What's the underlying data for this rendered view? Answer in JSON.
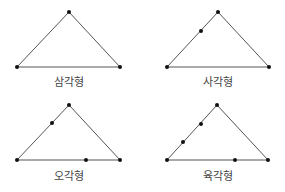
{
  "figures": [
    {
      "label": "삼각형",
      "vertices": [
        [
          69,
          12
        ],
        [
          17,
          67
        ],
        [
          120,
          67
        ]
      ],
      "extra_points": [],
      "label_pos": [
        69,
        86
      ]
    },
    {
      "label": "사각형",
      "vertices": [
        [
          218,
          12
        ],
        [
          167,
          67
        ],
        [
          269,
          67
        ]
      ],
      "extra_points": [
        [
          201,
          31
        ]
      ],
      "label_pos": [
        218,
        86
      ]
    },
    {
      "label": "오각형",
      "vertices": [
        [
          69,
          105
        ],
        [
          17,
          160
        ],
        [
          120,
          160
        ]
      ],
      "extra_points": [
        [
          52,
          123
        ],
        [
          86,
          160
        ]
      ],
      "label_pos": [
        69,
        180
      ]
    },
    {
      "label": "육각형",
      "vertices": [
        [
          217,
          105
        ],
        [
          167,
          160
        ],
        [
          268,
          160
        ]
      ],
      "extra_points": [
        [
          201,
          124
        ],
        [
          183,
          142
        ],
        [
          235,
          160
        ]
      ],
      "label_pos": [
        218,
        180
      ]
    }
  ],
  "colors": {
    "edge": "#555555",
    "point": "#111111",
    "label": "#444444"
  }
}
